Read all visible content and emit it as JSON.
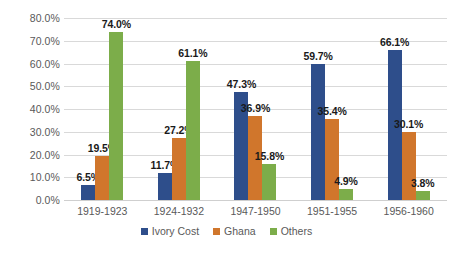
{
  "chart_data": {
    "type": "bar",
    "title": "",
    "subtitle": "",
    "xlabel": "",
    "ylabel": "",
    "ylim": [
      0,
      80
    ],
    "y_tick_step": 10,
    "y_ticks": [
      "0.0%",
      "10.0%",
      "20.0%",
      "30.0%",
      "40.0%",
      "50.0%",
      "60.0%",
      "70.0%",
      "80.0%"
    ],
    "y_tick_values": [
      0,
      10,
      20,
      30,
      40,
      50,
      60,
      70,
      80
    ],
    "grid": true,
    "legend_position": "bottom",
    "value_labels": true,
    "categories": [
      "1919-1923",
      "1924-1932",
      "1947-1950",
      "1951-1955",
      "1956-1960"
    ],
    "series": [
      {
        "name": "Ivory Cost",
        "color": "#2E4E8B",
        "values": [
          6.5,
          11.7,
          47.3,
          59.7,
          66.1
        ],
        "labels": [
          "6.5%",
          "11.7%",
          "47.3%",
          "59.7%",
          "66.1%"
        ]
      },
      {
        "name": "Ghana",
        "color": "#D0762C",
        "values": [
          19.5,
          27.2,
          36.9,
          35.4,
          30.1
        ],
        "labels": [
          "19.5%",
          "27.2%",
          "36.9%",
          "35.4%",
          "30.1%"
        ]
      },
      {
        "name": "Others",
        "color": "#7CAD4A",
        "values": [
          74.0,
          61.1,
          15.8,
          4.9,
          3.8
        ],
        "labels": [
          "74.0%",
          "61.1%",
          "15.8%",
          "4.9%",
          "3.8%"
        ]
      }
    ]
  },
  "colors": {
    "background": "#FFFFFF",
    "gridline": "#D9D9D9",
    "axis_text": "#595959",
    "label_text": "#1A1A1A",
    "series_ivory_cost": "#2E4E8B",
    "series_ghana": "#D0762C",
    "series_others": "#7CAD4A"
  }
}
